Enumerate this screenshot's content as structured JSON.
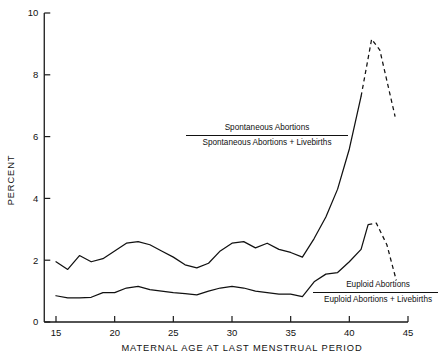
{
  "chart_data": {
    "type": "line",
    "title": "",
    "xlabel": "MATERNAL AGE AT LAST MENSTRUAL PERIOD",
    "ylabel": "PERCENT",
    "xlim": [
      14,
      45.5
    ],
    "ylim": [
      0,
      10
    ],
    "xticks": [
      15,
      20,
      25,
      30,
      35,
      40,
      45
    ],
    "yticks": [
      0,
      2,
      4,
      6,
      8,
      10
    ],
    "grid": false,
    "legend_position": "inside-plot",
    "series": [
      {
        "name": "Spontaneous Abortions / Spontaneous Abortions + Livebirths",
        "legend_numerator": "Spontaneous Abortions",
        "legend_denominator": "Spontaneous Abortions + Livebirths",
        "style": "solid-then-dashed",
        "dash_starts_at_x": 41.0,
        "x": [
          15,
          16,
          17,
          18,
          19,
          20,
          21,
          22,
          23,
          24,
          25,
          26,
          27,
          28,
          29,
          30,
          31,
          32,
          33,
          34,
          35,
          36,
          37,
          38,
          39,
          40,
          41,
          41.9,
          42.6,
          43.9
        ],
        "y": [
          1.95,
          1.7,
          2.15,
          1.95,
          2.05,
          2.3,
          2.55,
          2.6,
          2.5,
          2.3,
          2.1,
          1.85,
          1.75,
          1.9,
          2.3,
          2.55,
          2.6,
          2.4,
          2.55,
          2.35,
          2.25,
          2.1,
          2.7,
          3.4,
          4.3,
          5.6,
          7.3,
          9.15,
          8.8,
          6.65
        ]
      },
      {
        "name": "Euploid Abortions / Euploid Abortions + Livebirths",
        "legend_numerator": "Euploid Abortions",
        "legend_denominator": "Euploid Abortions + Livebirths",
        "style": "solid-then-dashed",
        "dash_starts_at_x": 41.6,
        "x": [
          15,
          16,
          17,
          18,
          19,
          20,
          21,
          22,
          23,
          24,
          25,
          26,
          27,
          28,
          29,
          30,
          31,
          32,
          33,
          34,
          35,
          36,
          37,
          38,
          39,
          40,
          41,
          41.6,
          42.3,
          43.2,
          44.0
        ],
        "y": [
          0.85,
          0.78,
          0.78,
          0.8,
          0.95,
          0.95,
          1.1,
          1.15,
          1.05,
          1.0,
          0.95,
          0.92,
          0.88,
          1.0,
          1.1,
          1.15,
          1.1,
          1.0,
          0.95,
          0.9,
          0.9,
          0.82,
          1.3,
          1.55,
          1.6,
          1.95,
          2.35,
          3.15,
          3.2,
          2.5,
          1.35
        ]
      }
    ]
  },
  "axes": {
    "y_label": "PERCENT",
    "x_label": "MATERNAL AGE AT LAST MENSTRUAL PERIOD",
    "y_tick_labels": [
      "0",
      "2",
      "4",
      "6",
      "8",
      "10"
    ],
    "x_tick_labels": [
      "15",
      "20",
      "25",
      "30",
      "35",
      "40",
      "45"
    ]
  },
  "legend": {
    "upper": {
      "numerator": "Spontaneous Abortions",
      "denominator": "Spontaneous Abortions + Livebirths"
    },
    "lower": {
      "numerator": "Euploid Abortions",
      "denominator": "Euploid Abortions + Livebirths"
    }
  },
  "colors": {
    "line": "#111111",
    "background": "#ffffff",
    "text": "#111111"
  }
}
